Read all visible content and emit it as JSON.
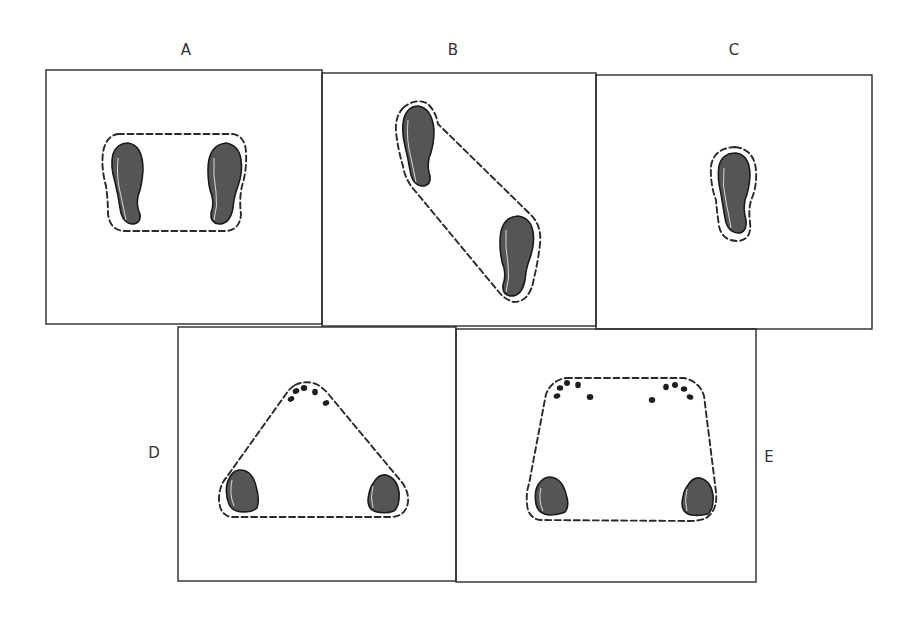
{
  "figure": {
    "title": "",
    "colors": {
      "frame": "#2b2b2b",
      "footprint_fill": "#555555",
      "outline": "#2a2a2a",
      "label": "#333333"
    },
    "panels": [
      {
        "id": "A",
        "label": "A",
        "caption": "Both feet side by side, base of support enclosing both feet"
      },
      {
        "id": "B",
        "label": "B",
        "caption": "Staggered feet diagonally, elongated base of support"
      },
      {
        "id": "C",
        "label": "C",
        "caption": "Single foot, base of support around one foot"
      },
      {
        "id": "D",
        "label": "D",
        "caption": "Two feet (heels) and one hand (fingertips), triangular base of support"
      },
      {
        "id": "E",
        "label": "E",
        "caption": "Two feet (heels) and two hands (fingertips), trapezoidal base of support"
      }
    ]
  }
}
